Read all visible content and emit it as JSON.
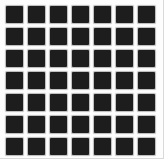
{
  "pattern": {
    "name": "hermann-grid-square-pattern",
    "description_visible_content": "7 by 7 grid of dark squares on a white background"
  },
  "grid": {
    "rows": 7,
    "cols": 7,
    "cell_px": 17,
    "gap_px": 5,
    "square_color": "#1d1d1d",
    "background_color": "#fdfdfd",
    "edge_tint_color": "#d9d9d9"
  }
}
